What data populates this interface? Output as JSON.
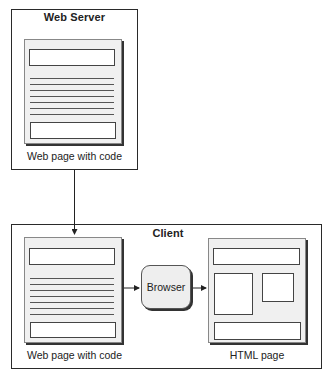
{
  "diagram": {
    "server": {
      "title": "Web Server",
      "page_label": "Web page with code"
    },
    "client": {
      "title": "Client",
      "source_page_label": "Web page with code",
      "browser_label": "Browser",
      "output_page_label": "HTML page"
    },
    "edges": [
      {
        "from": "server-web-page",
        "to": "client-web-page"
      },
      {
        "from": "client-web-page",
        "to": "browser"
      },
      {
        "from": "browser",
        "to": "html-page"
      }
    ]
  }
}
